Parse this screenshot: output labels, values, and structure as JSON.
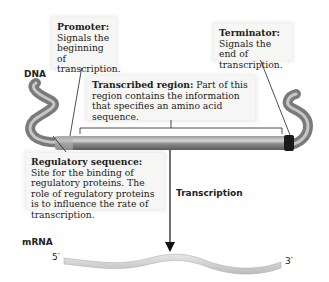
{
  "labels": {
    "dna": "DNA",
    "mrna": "mRNA",
    "transcription": "Transcription",
    "five_prime": "5′",
    "three_prime": "3′"
  },
  "callouts": {
    "promoter": {
      "term": "Promoter:",
      "text": "Signals the beginning of transcription."
    },
    "terminator": {
      "term": "Terminator:",
      "text": "Signals the end of transcription."
    },
    "transcribed_region": {
      "term": "Transcribed region:",
      "text": "Part of this region contains the information that specifies an amino acid sequence."
    },
    "regulatory_sequence": {
      "term": "Regulatory sequence:",
      "text": "Site for the binding of regulatory proteins. The role of regulatory proteins is to influence the rate of transcription."
    }
  },
  "colors": {
    "dna_tube": "#8a8a8a",
    "dna_highlight": "#d8d8d8",
    "terminator_band": "#1a1a1a",
    "mrna": "#cfcfcf",
    "callout_bg": "#f6f6f4"
  }
}
